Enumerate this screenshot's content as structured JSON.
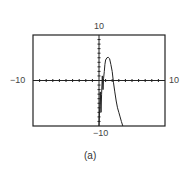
{
  "chart_data": {
    "type": "line",
    "title": "",
    "caption": "(a)",
    "xlabel": "",
    "ylabel": "",
    "xlim": [
      -10,
      10
    ],
    "ylim": [
      -10,
      10
    ],
    "xscale_tick": 1,
    "yscale_tick": 1,
    "grid": false,
    "legend": null,
    "window_labels": {
      "xmin": "−10",
      "xmax": "10",
      "ymin": "−10",
      "ymax": "10"
    },
    "series": [
      {
        "name": "f(x)",
        "color": "#222222",
        "x": [
          0.0,
          0.1,
          0.2,
          0.3,
          0.4,
          0.5,
          0.6,
          0.7,
          0.8,
          0.9,
          1.0,
          1.2,
          1.4,
          1.6,
          1.8,
          2.0,
          2.2,
          2.4,
          2.6,
          2.8,
          3.0,
          3.2,
          3.4,
          3.6
        ],
        "y": [
          -10,
          -6,
          -2.5,
          -7,
          -3,
          1,
          -2,
          0.5,
          2,
          3.5,
          4.5,
          5,
          5.1,
          4.8,
          3.5,
          2,
          -0.5,
          -2.5,
          -4.5,
          -6,
          -7,
          -8,
          -9,
          -10
        ]
      }
    ]
  },
  "axes": {
    "x_label_left": "−10",
    "x_label_right": "10",
    "y_label_top": "10",
    "y_label_bottom": "−10"
  }
}
